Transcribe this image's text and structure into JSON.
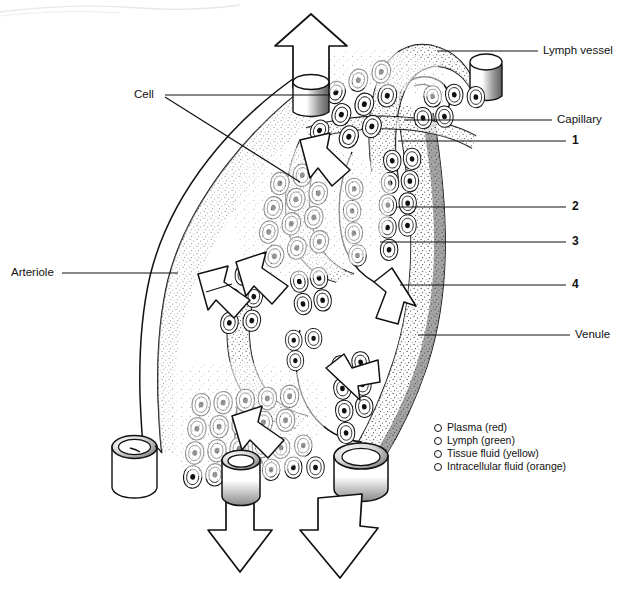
{
  "figure": {
    "style": "black-and-white line drawing with stipple shading",
    "background_color": "#ffffff",
    "ink_color": "#111111"
  },
  "labels": [
    {
      "id": "lymph-vessel",
      "text": "Lymph vessel",
      "side": "right"
    },
    {
      "id": "capillary",
      "text": "Capillary",
      "side": "right"
    },
    {
      "id": "num-1",
      "text": "1",
      "side": "right"
    },
    {
      "id": "num-2",
      "text": "2",
      "side": "right"
    },
    {
      "id": "num-3",
      "text": "3",
      "side": "right"
    },
    {
      "id": "num-4",
      "text": "4",
      "side": "right"
    },
    {
      "id": "venule",
      "text": "Venule",
      "side": "right"
    },
    {
      "id": "cell",
      "text": "Cell",
      "side": "left"
    },
    {
      "id": "arteriole",
      "text": "Arteriole",
      "side": "left"
    }
  ],
  "legend": {
    "items": [
      {
        "label": "Plasma (red)"
      },
      {
        "label": "Lymph (green)"
      },
      {
        "label": "Tissue fluid (yellow)"
      },
      {
        "label": "Intracellular fluid (orange)"
      }
    ]
  }
}
